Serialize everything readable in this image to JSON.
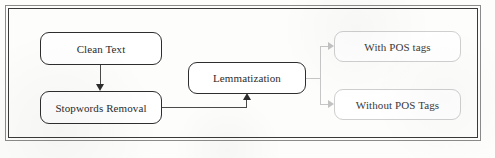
{
  "figure": {
    "frame": {
      "outer_color": "#8b8b8b",
      "inner_color": "#3a3a3a"
    },
    "background_color": "#fdfdfc"
  },
  "nodes": [
    {
      "id": "clean-text",
      "label": "Clean Text",
      "style": "dark-border",
      "border_color": "#2e2e2e"
    },
    {
      "id": "stopwords-removal",
      "label": "Stopwords Removal",
      "style": "dark-border",
      "border_color": "#2e2e2e"
    },
    {
      "id": "lemmatization",
      "label": "Lemmatization",
      "style": "dark-border",
      "border_color": "#2e2e2e"
    },
    {
      "id": "with-pos-tags",
      "label": "With POS tags",
      "style": "light-border",
      "border_color": "#cfcfcf"
    },
    {
      "id": "without-pos-tags",
      "label": "Without POS Tags",
      "style": "light-border",
      "border_color": "#cfcfcf"
    }
  ],
  "connectors": [
    {
      "id": "clean-to-stopwords",
      "from": "clean-text",
      "to": "stopwords-removal",
      "direction": "down",
      "arrowhead": true,
      "color": "#2c2c2c"
    },
    {
      "id": "stopwords-to-lemmatization",
      "from": "stopwords-removal",
      "to": "lemmatization",
      "direction": "right-then-up",
      "arrowhead": true,
      "color": "#2c2c2c"
    },
    {
      "id": "lemmatization-to-with-pos",
      "from": "lemmatization",
      "to": "with-pos-tags",
      "direction": "right",
      "arrowhead": true,
      "color": "#c2c2c2"
    },
    {
      "id": "lemmatization-to-without-pos",
      "from": "lemmatization",
      "to": "without-pos-tags",
      "direction": "right",
      "arrowhead": true,
      "color": "#c2c2c2"
    }
  ]
}
